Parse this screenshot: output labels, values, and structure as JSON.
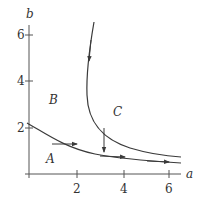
{
  "axes": {
    "x_label": "a",
    "y_label": "b",
    "x_ticks": [
      "2",
      "4",
      "6"
    ],
    "y_ticks": [
      "2",
      "4",
      "6"
    ]
  },
  "regions": {
    "A": "A",
    "B": "B",
    "C": "C"
  },
  "colors": {
    "line": "#3a3a3a",
    "text": "#333333"
  }
}
